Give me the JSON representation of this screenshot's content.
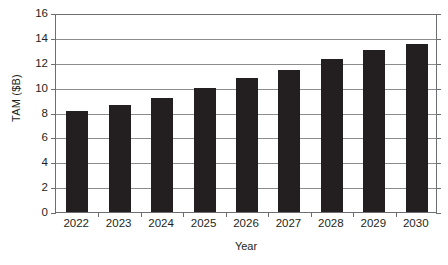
{
  "chart_data": {
    "type": "bar",
    "title": "",
    "xlabel": "Year",
    "ylabel": "TAM ($B)",
    "categories": [
      "2022",
      "2023",
      "2024",
      "2025",
      "2026",
      "2027",
      "2028",
      "2029",
      "2030"
    ],
    "values": [
      8.1,
      8.6,
      9.2,
      10.0,
      10.8,
      11.4,
      12.3,
      13.0,
      13.5
    ],
    "ylim": [
      0,
      16
    ],
    "ytick_labels": [
      "0",
      "2",
      "4",
      "6",
      "8",
      "10",
      "12",
      "14",
      "16"
    ],
    "ytick_values": [
      0,
      2,
      4,
      6,
      8,
      10,
      12,
      14,
      16
    ],
    "ytick_step": 2,
    "grid": true,
    "grid_axis": "y",
    "legend": "none",
    "series_color": "#231f20",
    "grid_color": "#8c8c8e",
    "axis_color": "#6d6e71",
    "background_color": "#ffffff",
    "text_color": "#231f20"
  }
}
